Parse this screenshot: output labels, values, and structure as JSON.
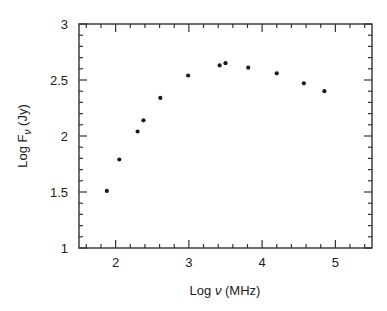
{
  "chart_data": {
    "type": "scatter",
    "title": "",
    "xlabel": "Log ν (MHz)",
    "ylabel": "Log F_ν (Jy)",
    "xlabel_parts": {
      "prefix": "Log ",
      "symbol": "ν",
      "suffix": " (MHz)"
    },
    "ylabel_parts": {
      "prefix": "Log F",
      "subscript": "ν",
      "suffix": " (Jy)"
    },
    "xlim": [
      1.5,
      5.5
    ],
    "ylim": [
      1,
      3
    ],
    "xticks": [
      2,
      3,
      4,
      5
    ],
    "xtick_labels": [
      "2",
      "3",
      "4",
      "5"
    ],
    "yticks": [
      1,
      1.5,
      2,
      2.5,
      3
    ],
    "ytick_labels": [
      "1",
      "1.5",
      "2",
      "2.5",
      "3"
    ],
    "x_minor_step": 0.2,
    "y_minor_step": 0.1,
    "grid": false,
    "legend": null,
    "series": [
      {
        "name": "flux density",
        "marker": "dot",
        "color": "#1a1a1a",
        "x": [
          1.88,
          2.05,
          2.3,
          2.38,
          2.61,
          2.99,
          3.42,
          3.5,
          3.81,
          4.2,
          4.57,
          4.85
        ],
        "y": [
          1.51,
          1.79,
          2.04,
          2.14,
          2.34,
          2.54,
          2.63,
          2.65,
          2.61,
          2.56,
          2.47,
          2.4
        ]
      }
    ]
  }
}
